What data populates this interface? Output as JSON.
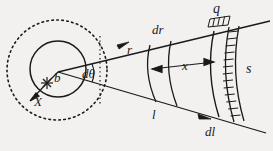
{
  "figure": {
    "type": "scattering-geometry-diagram",
    "title": "",
    "background_color": "#f2f1ef",
    "ink_color": "#1a1a1a"
  },
  "labels": {
    "impact_parameter": "b",
    "target_marker": "X",
    "angle_element": "dθ",
    "radius": "r",
    "radius_element": "dr",
    "arc_length": "l",
    "arc_length_element": "dl",
    "width": "x",
    "detector_arc": "s",
    "detector_box": "q"
  },
  "geometry": {
    "apex": {
      "x": 58,
      "y": 72
    },
    "solid_circle": {
      "cx": 57,
      "cy": 70,
      "r": 28
    },
    "dashed_circle": {
      "cx": 57,
      "cy": 70,
      "r": 50
    },
    "upper_ray_end": {
      "x": 268,
      "y": 22
    },
    "lower_ray_end": {
      "x": 262,
      "y": 131
    },
    "arcs": [
      {
        "name": "inner-arc"
      },
      {
        "name": "middle-arc"
      },
      {
        "name": "outer-arc"
      },
      {
        "name": "detector-arc"
      }
    ],
    "x_arrow": {
      "from": {
        "x": 163,
        "y": 67
      },
      "to": {
        "x": 214,
        "y": 62
      }
    }
  },
  "markers": {
    "impact_marker_point": {
      "x": 47,
      "y": 83
    },
    "x_label_point": {
      "x": 39,
      "y": 102
    }
  }
}
